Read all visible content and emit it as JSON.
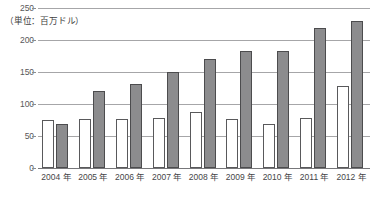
{
  "chart_data": {
    "type": "bar",
    "title": "",
    "subtitle": "",
    "unit_note": "（単位：百万ドル）",
    "xlabel": "",
    "ylabel": "",
    "ylim": [
      0,
      250
    ],
    "yticks": [
      0,
      50,
      100,
      150,
      200,
      250
    ],
    "ytick_labels": [
      "0",
      "50",
      "100",
      "150",
      "200",
      "250"
    ],
    "grid": true,
    "legend": "none",
    "categories": [
      "2004 年",
      "2005 年",
      "2006 年",
      "2007 年",
      "2008 年",
      "2009 年",
      "2010 年",
      "2011 年",
      "2012 年"
    ],
    "series": [
      {
        "name": "series-white",
        "color": "#ffffff",
        "edge_color": "#59595b",
        "values": [
          75,
          76,
          77,
          78,
          88,
          77,
          68,
          78,
          128
        ]
      },
      {
        "name": "series-gray",
        "color": "#8c8c8e",
        "edge_color": "#4c4c4e",
        "values": [
          69,
          120,
          132,
          150,
          170,
          183,
          183,
          218,
          230
        ]
      }
    ]
  },
  "colors": {
    "gridline": "#a6a6a8",
    "axis": "#77777a",
    "tick_text": "#58585a",
    "label_text": "#464648",
    "background": "#ffffff"
  }
}
